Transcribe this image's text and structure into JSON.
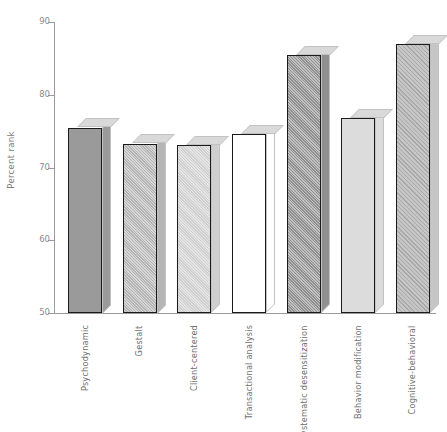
{
  "chart_data": {
    "type": "bar",
    "title": "",
    "xlabel": "",
    "ylabel": "Percent rank",
    "ylim": [
      50,
      90
    ],
    "yticks": [
      50,
      60,
      70,
      80,
      90
    ],
    "ytick_labels": [
      "50",
      "60",
      "70",
      "80",
      "90"
    ],
    "grid": false,
    "legend": null,
    "categories": [
      "Psychodynamic",
      "Gestalt",
      "Client-centered",
      "Transactional analysis",
      "Systematic desensitization",
      "Behavior modification",
      "Cognitive-behavioral"
    ],
    "values": [
      75.5,
      73.3,
      73.1,
      74.6,
      85.4,
      76.8,
      87.0
    ],
    "bar_styles": [
      {
        "fill": "#9a9a9a",
        "pattern": "solid"
      },
      {
        "fill": "#b5b5b5",
        "pattern": "texture"
      },
      {
        "fill": "#cfcfcf",
        "pattern": "texture"
      },
      {
        "fill": "#ffffff",
        "pattern": "solid"
      },
      {
        "fill": "#8f8f8f",
        "pattern": "texture"
      },
      {
        "fill": "#dcdcdc",
        "pattern": "solid"
      },
      {
        "fill": "#c6c6c6",
        "pattern": "hatch"
      }
    ],
    "colors": {
      "axis": "#9a9a9a",
      "tick_text": "#8a8a8a",
      "label_text": "#6e6e6e",
      "bar_outline": "#1a1a1a",
      "bar_top": "#d9d9d9",
      "bar_side": "#cfcfcf",
      "background": "#ffffff"
    }
  }
}
